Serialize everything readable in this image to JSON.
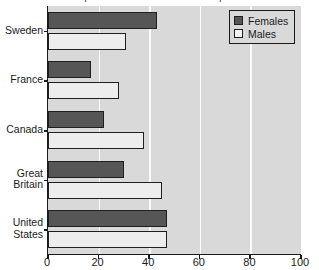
{
  "chart_data": {
    "type": "bar",
    "orientation": "horizontal",
    "title": "% reported to have had five or more partners",
    "xlabel": "",
    "ylabel": "",
    "categories": [
      "Sweden",
      "France",
      "Canada",
      "Great Britain",
      "United States"
    ],
    "series": [
      {
        "name": "Females",
        "color": "#565656",
        "values": [
          43,
          17,
          22,
          30,
          47
        ]
      },
      {
        "name": "Males",
        "color": "#ededed",
        "values": [
          31,
          28,
          38,
          45,
          47
        ]
      }
    ],
    "xlim": [
      0,
      100
    ],
    "xticks": [
      0,
      20,
      40,
      60,
      80,
      100
    ],
    "xtick_labels": [
      "0",
      "20",
      "40",
      "60",
      "80",
      "100"
    ],
    "grid": "vertical-white",
    "gridline_values": [
      20,
      40,
      60,
      80
    ],
    "legend_position": "top-right",
    "plot_background": "#d9d9d9",
    "axis_color": "#1a1a1a"
  },
  "legend": {
    "items": [
      {
        "label": "Females"
      },
      {
        "label": "Males"
      }
    ]
  }
}
